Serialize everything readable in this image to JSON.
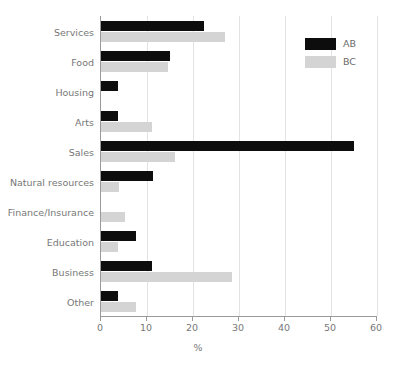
{
  "chart_data": {
    "type": "bar",
    "orientation": "horizontal",
    "title": "",
    "xlabel": "%",
    "ylabel": "",
    "xlim": [
      0,
      60
    ],
    "xticks": [
      0,
      10,
      20,
      30,
      40,
      50,
      60
    ],
    "xticklabels": [
      "0",
      "10",
      "20",
      "30",
      "40",
      "50",
      "60"
    ],
    "grid": true,
    "grid_axis": "x",
    "legend_position": "top-right",
    "categories": [
      "Services",
      "Food",
      "Housing",
      "Arts",
      "Sales",
      "Natural resources",
      "Finance/Insurance",
      "Education",
      "Business",
      "Other"
    ],
    "series": [
      {
        "name": "AB",
        "color": "#0d0d0d",
        "values": [
          22.4,
          15.0,
          3.8,
          3.8,
          55.0,
          11.3,
          0.0,
          7.6,
          11.1,
          3.8
        ]
      },
      {
        "name": "BC",
        "color": "#d4d4d4",
        "values": [
          27.0,
          14.6,
          0.0,
          11.0,
          16.0,
          4.0,
          5.2,
          3.8,
          28.5,
          7.6
        ]
      }
    ]
  },
  "legend": {
    "entries": [
      {
        "label": "AB",
        "color": "#0d0d0d"
      },
      {
        "label": "BC",
        "color": "#d4d4d4"
      }
    ]
  },
  "axis": {
    "x_title": "%"
  }
}
